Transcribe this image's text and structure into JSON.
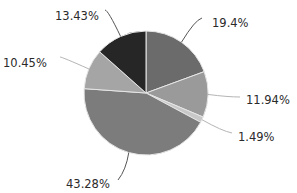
{
  "chart_data": {
    "type": "pie",
    "title": "",
    "start_angle": "12 o'clock",
    "direction": "clockwise",
    "legend": "none",
    "slices": [
      {
        "label": "19.4%",
        "value": 19.4,
        "color": "#6b6b6b"
      },
      {
        "label": "11.94%",
        "value": 11.94,
        "color": "#9a9a9a"
      },
      {
        "label": "1.49%",
        "value": 1.49,
        "color": "#c8c8c8"
      },
      {
        "label": "43.28%",
        "value": 43.28,
        "color": "#7c7c7c"
      },
      {
        "label": "10.45%",
        "value": 10.45,
        "color": "#a5a5a5"
      },
      {
        "label": "13.43%",
        "value": 13.43,
        "color": "#262626"
      }
    ]
  }
}
